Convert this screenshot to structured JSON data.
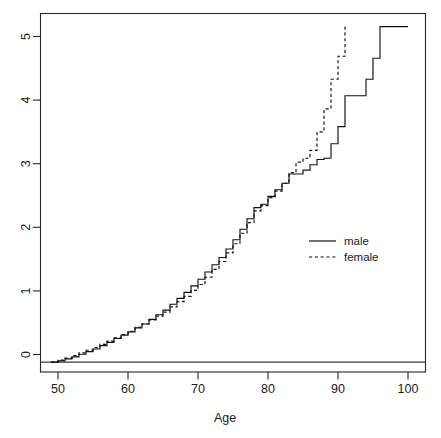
{
  "chart_data": {
    "type": "line",
    "title": "",
    "subtitle": "",
    "xlabel": "Age",
    "ylabel": "",
    "xlim": [
      47.5,
      102.5
    ],
    "ylim": [
      -0.15,
      5.3
    ],
    "grid": false,
    "legend_position": "center-right",
    "xticks": [
      50,
      60,
      70,
      80,
      90,
      100
    ],
    "yticks": [
      0,
      1,
      2,
      3,
      4,
      5
    ],
    "xtick_labels": [
      "50",
      "60",
      "70",
      "80",
      "90",
      "100"
    ],
    "ytick_labels": [
      "0",
      "1",
      "2",
      "3",
      "4",
      "5"
    ],
    "annotations": [
      "horizontal reference line at y = 0"
    ],
    "series": [
      {
        "name": "male",
        "linestyle": "solid",
        "color": "#111111",
        "x": [
          49.0,
          50.0,
          51.0,
          52.0,
          53.0,
          54.0,
          55.0,
          56.0,
          57.0,
          58.0,
          59.0,
          60.0,
          61.0,
          62.0,
          63.0,
          64.0,
          65.0,
          66.0,
          67.0,
          68.0,
          69.0,
          70.0,
          71.0,
          72.0,
          73.0,
          74.0,
          75.0,
          76.0,
          77.0,
          78.0,
          79.0,
          80.0,
          81.0,
          82.0,
          83.0,
          84.0,
          85.0,
          86.0,
          87.0,
          88.0,
          89.0,
          90.0,
          91.0,
          92.0,
          93.0,
          94.0,
          95.0,
          96.0,
          100.0
        ],
        "values": [
          0.0,
          0.02,
          0.05,
          0.08,
          0.12,
          0.16,
          0.2,
          0.25,
          0.3,
          0.36,
          0.41,
          0.46,
          0.52,
          0.58,
          0.65,
          0.72,
          0.79,
          0.88,
          0.97,
          1.06,
          1.16,
          1.26,
          1.37,
          1.48,
          1.59,
          1.72,
          1.86,
          2.02,
          2.18,
          2.35,
          2.4,
          2.52,
          2.62,
          2.72,
          2.86,
          2.86,
          2.92,
          3.0,
          3.08,
          3.1,
          3.32,
          3.58,
          4.05,
          4.05,
          4.05,
          4.3,
          4.62,
          5.1,
          5.1
        ]
      },
      {
        "name": "female",
        "linestyle": "dashed",
        "color": "#111111",
        "x": [
          49.0,
          50.0,
          51.0,
          52.0,
          53.0,
          54.0,
          55.0,
          56.0,
          57.0,
          58.0,
          59.0,
          60.0,
          61.0,
          62.0,
          63.0,
          64.0,
          65.0,
          66.0,
          67.0,
          68.0,
          69.0,
          70.0,
          71.0,
          72.0,
          73.0,
          74.0,
          75.0,
          76.0,
          77.0,
          78.0,
          79.0,
          80.0,
          81.0,
          82.0,
          83.0,
          84.0,
          85.0,
          86.0,
          87.0,
          88.0,
          89.0,
          90.0,
          91.0
        ],
        "values": [
          0.0,
          0.03,
          0.06,
          0.1,
          0.14,
          0.18,
          0.22,
          0.27,
          0.32,
          0.37,
          0.42,
          0.47,
          0.53,
          0.58,
          0.64,
          0.7,
          0.76,
          0.84,
          0.92,
          1.0,
          1.09,
          1.18,
          1.29,
          1.41,
          1.53,
          1.66,
          1.8,
          1.96,
          2.12,
          2.3,
          2.38,
          2.5,
          2.6,
          2.72,
          2.88,
          3.04,
          3.1,
          3.22,
          3.5,
          3.85,
          4.3,
          4.65,
          5.12
        ]
      }
    ]
  },
  "axes": {
    "x_label": "Age",
    "y_label": "",
    "x_tick_labels": [
      "50",
      "60",
      "70",
      "80",
      "90",
      "100"
    ],
    "y_tick_labels": [
      "0",
      "1",
      "2",
      "3",
      "4",
      "5"
    ]
  },
  "legend": {
    "entries": [
      {
        "label": "male",
        "style": "solid"
      },
      {
        "label": "female",
        "style": "dashed"
      }
    ]
  },
  "colors": {
    "line": "#111111",
    "frame": "#262626",
    "background": "#ffffff"
  }
}
